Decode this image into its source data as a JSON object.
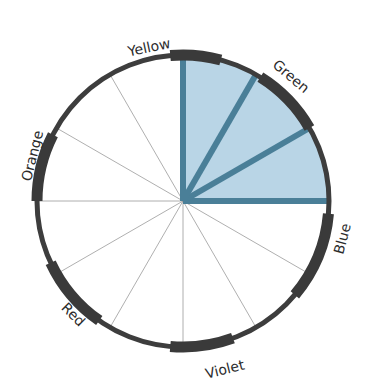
{
  "diagram": {
    "type": "color-wheel",
    "center": [
      183,
      201
    ],
    "radius": 146,
    "spoke_count": 12,
    "colors": {
      "rim": "#3d3d3d",
      "band": "#3a3a3a",
      "spoke": "#9a9a9a",
      "highlight_fill": "#b9d5e6",
      "highlight_stroke": "#4a7f98"
    },
    "highlight": {
      "start_deg": 0,
      "end_deg": 90,
      "spokes_deg": [
        0,
        30,
        60,
        90
      ]
    },
    "labels": [
      {
        "text": "Yellow",
        "angle_deg": 106
      },
      {
        "text": "Green",
        "angle_deg": 52
      },
      {
        "text": "Blue",
        "angle_deg": -15
      },
      {
        "text": "Violet",
        "angle_deg": -78
      },
      {
        "text": "Red",
        "angle_deg": -132
      },
      {
        "text": "Orange",
        "angle_deg": 166
      }
    ]
  }
}
